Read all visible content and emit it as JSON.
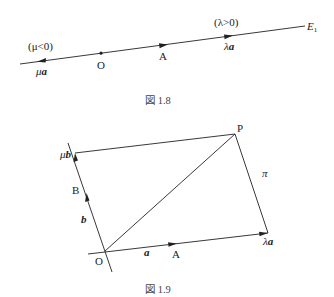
{
  "figure_1_8": {
    "caption": "図 1.8",
    "line_label": "E",
    "line_label_sub": "1",
    "mu_condition": "(μ<0)",
    "lambda_condition": "(λ>0)",
    "labels": {
      "origin": "O",
      "point_a": "A",
      "mu": "μ",
      "mu_vec": "a",
      "lambda": "λ",
      "lambda_vec": "a"
    }
  },
  "figure_1_9": {
    "caption": "図 1.9",
    "labels": {
      "origin": "O",
      "point_a": "A",
      "point_b": "B",
      "point_p": "P",
      "vec_a": "a",
      "vec_b": "b",
      "mu": "μ",
      "mu_vec": "b",
      "lambda": "λ",
      "lambda_vec": "a",
      "plane": "π"
    }
  },
  "colors": {
    "stroke": "#222222",
    "background": "#ffffff"
  }
}
